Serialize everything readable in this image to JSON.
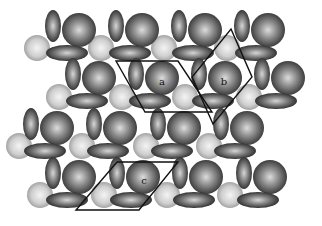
{
  "figure": {
    "width": 322,
    "height": 226,
    "background": "#ffffff",
    "colors": {
      "dark_sphere_light": "#d8d8d8",
      "dark_sphere_mid": "#7a7a7a",
      "dark_sphere_edge": "#2e2e2e",
      "light_sphere_light": "#f2f2f2",
      "light_sphere_edge": "#9a9a9a",
      "outline": "#111111"
    }
  },
  "units": [
    {
      "row": 1,
      "x": 79,
      "y": 30
    },
    {
      "row": 1,
      "x": 142,
      "y": 30
    },
    {
      "row": 1,
      "x": 205,
      "y": 30
    },
    {
      "row": 1,
      "x": 268,
      "y": 30
    },
    {
      "row": 2,
      "x": 99,
      "y": 78
    },
    {
      "row": 2,
      "x": 162,
      "y": 78
    },
    {
      "row": 2,
      "x": 225,
      "y": 78
    },
    {
      "row": 2,
      "x": 288,
      "y": 78
    },
    {
      "row": 3,
      "x": 57,
      "y": 128
    },
    {
      "row": 3,
      "x": 120,
      "y": 128
    },
    {
      "row": 3,
      "x": 184,
      "y": 128
    },
    {
      "row": 3,
      "x": 247,
      "y": 128
    },
    {
      "row": 4,
      "x": 79,
      "y": 177
    },
    {
      "row": 4,
      "x": 143,
      "y": 177
    },
    {
      "row": 4,
      "x": 206,
      "y": 177
    },
    {
      "row": 4,
      "x": 270,
      "y": 177
    }
  ],
  "small_spheres": [
    {
      "x": 37,
      "y": 48
    },
    {
      "x": 101,
      "y": 48
    },
    {
      "x": 164,
      "y": 48
    },
    {
      "x": 227,
      "y": 48
    },
    {
      "x": 59,
      "y": 97
    },
    {
      "x": 122,
      "y": 97
    },
    {
      "x": 185,
      "y": 97
    },
    {
      "x": 249,
      "y": 97
    },
    {
      "x": 19,
      "y": 146
    },
    {
      "x": 82,
      "y": 146
    },
    {
      "x": 146,
      "y": 146
    },
    {
      "x": 209,
      "y": 146
    },
    {
      "x": 40,
      "y": 195
    },
    {
      "x": 104,
      "y": 195
    },
    {
      "x": 167,
      "y": 195
    },
    {
      "x": 230,
      "y": 195
    }
  ],
  "cells": [
    {
      "id": "a",
      "label": "a",
      "points": "116,61 178,61 212,112 145,112",
      "label_x": 162,
      "label_y": 82
    },
    {
      "id": "b",
      "label": "b",
      "points": "231,29 252,77 213,124 192,77",
      "label_x": 224,
      "label_y": 82
    },
    {
      "id": "c",
      "label": "c",
      "points": "117,162 178,162 139,210 76,210",
      "label_x": 144,
      "label_y": 181
    }
  ],
  "labels": {
    "a": "a",
    "b": "b",
    "c": "c"
  }
}
